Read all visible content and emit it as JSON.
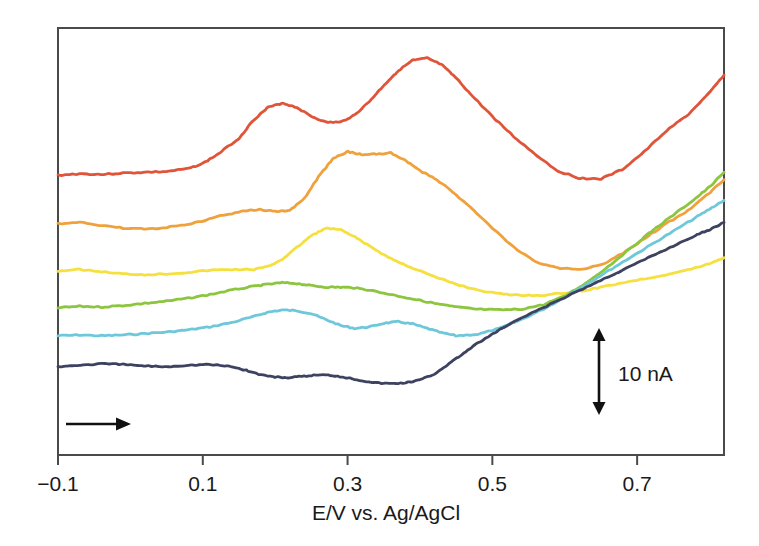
{
  "chart_data": {
    "type": "line",
    "title": "",
    "subtitle": "",
    "xlabel": "E/V vs. Ag/AgCl",
    "ylabel": "",
    "xlim": [
      -0.1,
      0.82
    ],
    "ylim": [
      0,
      58
    ],
    "grid": false,
    "legend": "none",
    "xticks": [
      -0.1,
      0.1,
      0.3,
      0.5,
      0.7
    ],
    "xtick_labels": [
      "−0.1",
      "0.1",
      "0.3",
      "0.5",
      "0.7"
    ],
    "yaxis_visible": false,
    "annotations": [
      {
        "name": "current-scale-bar",
        "label": "10 nA",
        "kind": "double-arrow-vertical",
        "x": 0.638,
        "y_from": 6.5,
        "y_to": 18.6
      },
      {
        "name": "scan-direction-arrow",
        "label": "",
        "kind": "arrow-right",
        "x_from": -0.091,
        "x_to": -0.009,
        "y": 3.0
      }
    ],
    "series": [
      {
        "name": "trace-1-red",
        "color": "#e0543a",
        "x": [
          -0.1,
          -0.07,
          -0.04,
          -0.01,
          0.02,
          0.05,
          0.08,
          0.1,
          0.12,
          0.15,
          0.17,
          0.19,
          0.21,
          0.23,
          0.25,
          0.27,
          0.29,
          0.31,
          0.33,
          0.35,
          0.37,
          0.39,
          0.41,
          0.43,
          0.45,
          0.47,
          0.5,
          0.53,
          0.56,
          0.59,
          0.62,
          0.65,
          0.68,
          0.71,
          0.74,
          0.77,
          0.8,
          0.82
        ],
        "y": [
          38.0,
          38.2,
          38.1,
          38.3,
          38.4,
          38.5,
          38.9,
          39.6,
          40.8,
          43.0,
          45.5,
          47.2,
          47.8,
          47.2,
          46.0,
          45.2,
          45.2,
          46.2,
          48.0,
          50.2,
          52.2,
          53.6,
          53.9,
          53.0,
          51.2,
          49.0,
          46.0,
          43.2,
          40.8,
          38.6,
          37.6,
          37.5,
          38.8,
          41.2,
          44.0,
          46.2,
          49.2,
          51.6
        ]
      },
      {
        "name": "trace-2-orange",
        "color": "#f0a13c",
        "x": [
          -0.1,
          -0.07,
          -0.04,
          -0.01,
          0.02,
          0.05,
          0.08,
          0.1,
          0.13,
          0.16,
          0.18,
          0.2,
          0.22,
          0.24,
          0.26,
          0.28,
          0.3,
          0.32,
          0.34,
          0.36,
          0.38,
          0.4,
          0.42,
          0.44,
          0.47,
          0.5,
          0.53,
          0.56,
          0.59,
          0.62,
          0.65,
          0.68,
          0.71,
          0.74,
          0.77,
          0.8,
          0.82
        ],
        "y": [
          31.4,
          31.6,
          31.2,
          30.8,
          30.7,
          30.9,
          31.3,
          31.8,
          32.6,
          33.2,
          33.3,
          33.1,
          33.2,
          34.8,
          37.8,
          40.3,
          41.2,
          40.8,
          40.9,
          41.0,
          40.0,
          38.6,
          37.6,
          36.2,
          33.6,
          30.8,
          28.2,
          26.2,
          25.4,
          25.2,
          25.8,
          27.4,
          29.4,
          31.4,
          33.2,
          35.6,
          37.4
        ]
      },
      {
        "name": "trace-3-yellow",
        "color": "#f5e03f",
        "x": [
          -0.1,
          -0.07,
          -0.04,
          -0.01,
          0.02,
          0.05,
          0.08,
          0.11,
          0.14,
          0.17,
          0.19,
          0.21,
          0.23,
          0.25,
          0.27,
          0.29,
          0.31,
          0.33,
          0.35,
          0.37,
          0.39,
          0.42,
          0.45,
          0.48,
          0.51,
          0.54,
          0.57,
          0.6,
          0.63,
          0.66,
          0.69,
          0.72,
          0.75,
          0.78,
          0.8,
          0.82
        ],
        "y": [
          25.0,
          25.2,
          24.9,
          24.6,
          24.5,
          24.6,
          24.8,
          25.1,
          25.2,
          25.2,
          25.6,
          26.6,
          28.2,
          29.8,
          30.8,
          30.6,
          29.6,
          28.4,
          27.2,
          26.2,
          25.4,
          24.2,
          23.2,
          22.4,
          21.9,
          21.7,
          21.7,
          22.0,
          22.4,
          23.0,
          23.6,
          24.1,
          24.7,
          25.4,
          26.0,
          26.8
        ]
      },
      {
        "name": "trace-4-green",
        "color": "#8cc63e",
        "x": [
          -0.1,
          -0.07,
          -0.04,
          -0.01,
          0.02,
          0.05,
          0.08,
          0.11,
          0.14,
          0.17,
          0.19,
          0.21,
          0.23,
          0.25,
          0.27,
          0.29,
          0.31,
          0.33,
          0.36,
          0.39,
          0.42,
          0.45,
          0.48,
          0.51,
          0.54,
          0.57,
          0.6,
          0.63,
          0.66,
          0.69,
          0.72,
          0.75,
          0.78,
          0.8,
          0.82
        ],
        "y": [
          20.0,
          20.2,
          20.1,
          20.3,
          20.6,
          20.9,
          21.3,
          21.8,
          22.4,
          22.9,
          23.2,
          23.4,
          23.3,
          23.0,
          22.8,
          22.8,
          22.7,
          22.4,
          21.8,
          21.2,
          20.6,
          20.1,
          19.8,
          19.7,
          19.8,
          20.4,
          21.6,
          23.4,
          25.6,
          28.0,
          30.4,
          32.6,
          34.8,
          36.4,
          38.4
        ]
      },
      {
        "name": "trace-5-cyan",
        "color": "#6ec8da",
        "x": [
          -0.1,
          -0.07,
          -0.04,
          -0.01,
          0.02,
          0.05,
          0.08,
          0.11,
          0.14,
          0.17,
          0.19,
          0.21,
          0.23,
          0.25,
          0.27,
          0.29,
          0.31,
          0.33,
          0.35,
          0.37,
          0.39,
          0.41,
          0.43,
          0.45,
          0.48,
          0.51,
          0.54,
          0.57,
          0.6,
          0.63,
          0.66,
          0.69,
          0.72,
          0.75,
          0.78,
          0.8,
          0.82
        ],
        "y": [
          16.2,
          16.3,
          16.2,
          16.3,
          16.5,
          16.7,
          17.0,
          17.4,
          18.0,
          18.8,
          19.4,
          19.7,
          19.6,
          19.2,
          18.4,
          17.6,
          17.2,
          17.4,
          17.9,
          18.1,
          17.8,
          17.2,
          16.6,
          16.2,
          16.4,
          17.2,
          18.4,
          19.8,
          21.4,
          23.2,
          25.0,
          26.8,
          28.6,
          30.4,
          32.2,
          33.4,
          34.6
        ]
      },
      {
        "name": "trace-6-navy",
        "color": "#3c4260",
        "x": [
          -0.1,
          -0.07,
          -0.04,
          -0.01,
          0.02,
          0.05,
          0.08,
          0.11,
          0.14,
          0.16,
          0.18,
          0.2,
          0.22,
          0.24,
          0.26,
          0.28,
          0.3,
          0.32,
          0.34,
          0.36,
          0.38,
          0.4,
          0.42,
          0.44,
          0.46,
          0.48,
          0.51,
          0.54,
          0.57,
          0.6,
          0.63,
          0.66,
          0.69,
          0.72,
          0.75,
          0.78,
          0.8,
          0.82
        ],
        "y": [
          12.0,
          12.2,
          12.4,
          12.3,
          12.1,
          12.0,
          12.2,
          12.3,
          12.0,
          11.5,
          10.9,
          10.6,
          10.5,
          10.7,
          10.9,
          10.8,
          10.5,
          10.1,
          9.8,
          9.7,
          9.8,
          10.2,
          11.0,
          12.4,
          13.8,
          15.2,
          17.0,
          18.6,
          20.0,
          21.4,
          22.8,
          24.2,
          25.6,
          27.0,
          28.4,
          29.8,
          30.6,
          31.6
        ]
      }
    ]
  },
  "axes": {
    "x_tick_labels": [
      "−0.1",
      "0.1",
      "0.3",
      "0.5",
      "0.7"
    ],
    "x_axis_title": "E/V vs. Ag/AgCl"
  },
  "scale_bar": {
    "label": "10 nA"
  },
  "colors": {
    "frame": "#4a4a4a",
    "text": "#1a1a1a",
    "background": "#ffffff",
    "trace_1": "#e0543a",
    "trace_2": "#f0a13c",
    "trace_3": "#f5e03f",
    "trace_4": "#8cc63e",
    "trace_5": "#6ec8da",
    "trace_6": "#3c4260"
  }
}
